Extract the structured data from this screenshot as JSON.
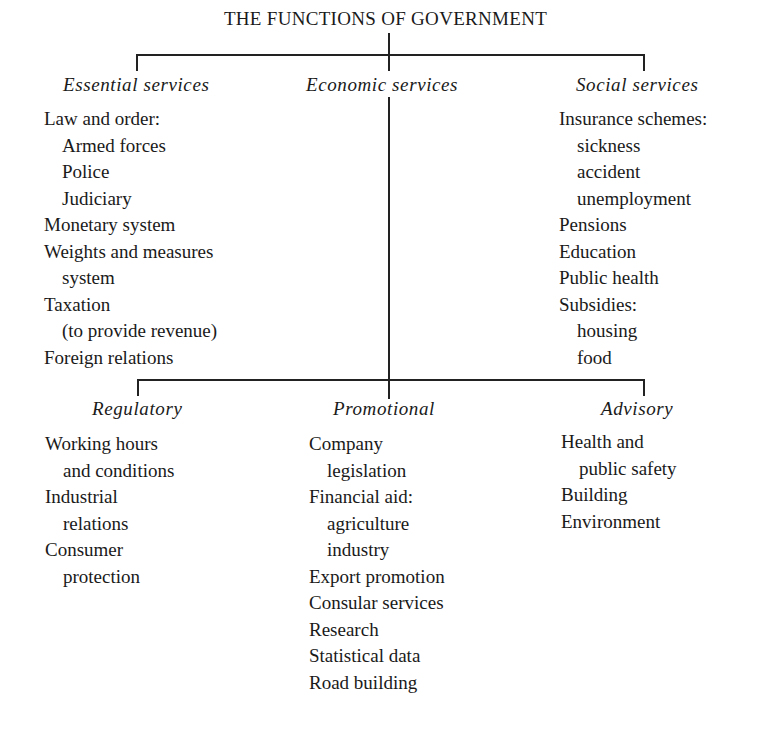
{
  "title": "THE FUNCTIONS OF GOVERNMENT",
  "top_level": {
    "essential": {
      "heading": "Essential services",
      "items": [
        {
          "text": "Law and order:",
          "indent": false
        },
        {
          "text": "Armed forces",
          "indent": true
        },
        {
          "text": "Police",
          "indent": true
        },
        {
          "text": "Judiciary",
          "indent": true
        },
        {
          "text": "Monetary system",
          "indent": false
        },
        {
          "text": "Weights and measures",
          "indent": false
        },
        {
          "text": "system",
          "indent": true
        },
        {
          "text": "Taxation",
          "indent": false
        },
        {
          "text": "(to provide revenue)",
          "indent": true
        },
        {
          "text": "Foreign relations",
          "indent": false
        }
      ]
    },
    "economic": {
      "heading": "Economic services"
    },
    "social": {
      "heading": "Social services",
      "items": [
        {
          "text": "Insurance schemes:",
          "indent": false
        },
        {
          "text": "sickness",
          "indent": true
        },
        {
          "text": "accident",
          "indent": true
        },
        {
          "text": "unemployment",
          "indent": true
        },
        {
          "text": "Pensions",
          "indent": false
        },
        {
          "text": "Education",
          "indent": false
        },
        {
          "text": "Public health",
          "indent": false
        },
        {
          "text": "Subsidies:",
          "indent": false
        },
        {
          "text": "housing",
          "indent": true
        },
        {
          "text": "food",
          "indent": true
        }
      ]
    }
  },
  "economic_subdivisions": {
    "regulatory": {
      "heading": "Regulatory",
      "items": [
        {
          "text": "Working hours",
          "indent": false
        },
        {
          "text": "and conditions",
          "indent": true
        },
        {
          "text": "Industrial",
          "indent": false
        },
        {
          "text": "relations",
          "indent": true
        },
        {
          "text": "Consumer",
          "indent": false
        },
        {
          "text": "protection",
          "indent": true
        }
      ]
    },
    "promotional": {
      "heading": "Promotional",
      "items": [
        {
          "text": "Company",
          "indent": false
        },
        {
          "text": "legislation",
          "indent": true
        },
        {
          "text": "Financial aid:",
          "indent": false
        },
        {
          "text": "agriculture",
          "indent": true
        },
        {
          "text": "industry",
          "indent": true
        },
        {
          "text": "Export promotion",
          "indent": false
        },
        {
          "text": "Consular services",
          "indent": false
        },
        {
          "text": "Research",
          "indent": false
        },
        {
          "text": "Statistical data",
          "indent": false
        },
        {
          "text": "Road building",
          "indent": false
        }
      ]
    },
    "advisory": {
      "heading": "Advisory",
      "items": [
        {
          "text": "Health and",
          "indent": false
        },
        {
          "text": "public safety",
          "indent": true
        },
        {
          "text": "Building",
          "indent": false
        },
        {
          "text": "Environment",
          "indent": false
        }
      ]
    }
  },
  "colors": {
    "ink": "#1a1a1a",
    "background": "#ffffff"
  }
}
